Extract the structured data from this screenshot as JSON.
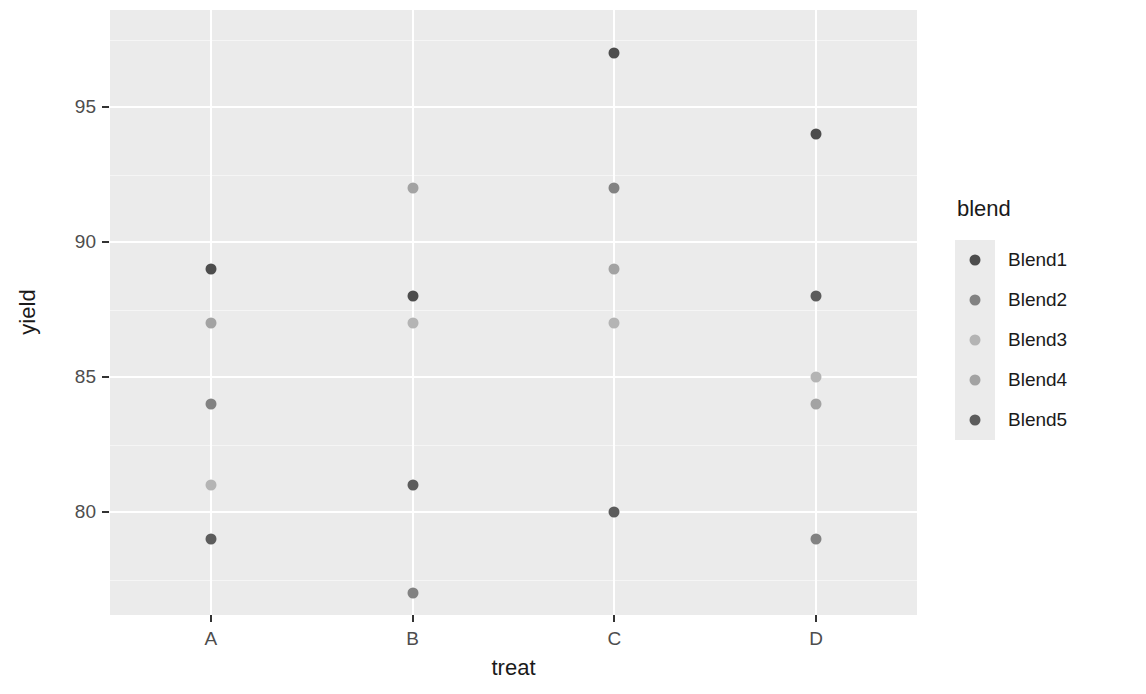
{
  "chart_data": {
    "type": "scatter",
    "title": "",
    "xlabel": "treat",
    "ylabel": "yield",
    "categories": [
      "A",
      "B",
      "C",
      "D"
    ],
    "x_tick_labels": [
      "A",
      "B",
      "C",
      "D"
    ],
    "y_tick_labels": [
      "80",
      "85",
      "90",
      "95"
    ],
    "y_tick_values": [
      80,
      85,
      90,
      95
    ],
    "ylim": [
      76.2,
      98.6
    ],
    "grid": true,
    "legend_position": "right",
    "legend_title": "blend",
    "series": [
      {
        "name": "Blend1",
        "color": "#4d4d4d",
        "points": [
          {
            "x": "A",
            "y": 89
          },
          {
            "x": "B",
            "y": 88
          },
          {
            "x": "C",
            "y": 97
          },
          {
            "x": "D",
            "y": 94
          }
        ]
      },
      {
        "name": "Blend2",
        "color": "#828282",
        "points": [
          {
            "x": "A",
            "y": 84
          },
          {
            "x": "B",
            "y": 77
          },
          {
            "x": "C",
            "y": 92
          },
          {
            "x": "D",
            "y": 79
          }
        ]
      },
      {
        "name": "Blend3",
        "color": "#b4b4b4",
        "points": [
          {
            "x": "A",
            "y": 81
          },
          {
            "x": "B",
            "y": 87
          },
          {
            "x": "C",
            "y": 87
          },
          {
            "x": "D",
            "y": 85
          }
        ]
      },
      {
        "name": "Blend4",
        "color": "#a3a3a3",
        "points": [
          {
            "x": "A",
            "y": 87
          },
          {
            "x": "B",
            "y": 92
          },
          {
            "x": "C",
            "y": 89
          },
          {
            "x": "D",
            "y": 84
          }
        ]
      },
      {
        "name": "Blend5",
        "color": "#5c5c5c",
        "points": [
          {
            "x": "A",
            "y": 79
          },
          {
            "x": "B",
            "y": 81
          },
          {
            "x": "C",
            "y": 80
          },
          {
            "x": "D",
            "y": 88
          }
        ]
      }
    ]
  },
  "axis": {
    "y_title": "yield",
    "x_title": "treat"
  },
  "legend": {
    "title": "blend",
    "items": [
      {
        "label": "Blend1",
        "color": "#4d4d4d"
      },
      {
        "label": "Blend2",
        "color": "#828282"
      },
      {
        "label": "Blend3",
        "color": "#b4b4b4"
      },
      {
        "label": "Blend4",
        "color": "#a3a3a3"
      },
      {
        "label": "Blend5",
        "color": "#5c5c5c"
      }
    ]
  },
  "theme": {
    "panel_background": "#ebebeb",
    "gridline_major": "#ffffff",
    "gridline_minor": "#f5f5f5",
    "text_color": "#1a1a1a",
    "axis_text_color": "#4d4d4d"
  }
}
